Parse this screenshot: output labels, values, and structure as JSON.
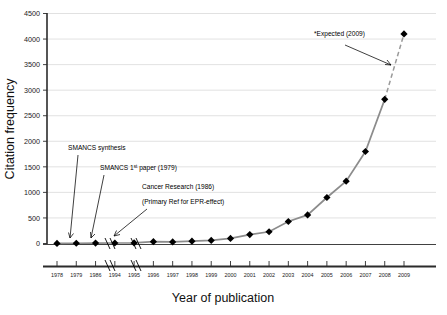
{
  "chart_data": {
    "type": "line",
    "title": "",
    "xlabel": "Year of publication",
    "ylabel": "Citation frequency",
    "ylim": [
      0,
      4500
    ],
    "ytick_step": 500,
    "grid": true,
    "legend": "none",
    "categories": [
      "1978",
      "1979",
      "1986",
      "1994",
      "1995",
      "1996",
      "1997",
      "1998",
      "1999",
      "2000",
      "2001",
      "2002",
      "2003",
      "2004",
      "2005",
      "2006",
      "2007",
      "2008",
      "2009"
    ],
    "values": [
      2,
      5,
      8,
      10,
      12,
      35,
      30,
      45,
      60,
      100,
      175,
      230,
      430,
      560,
      900,
      1220,
      1800,
      2820,
      4100
    ],
    "series": [
      {
        "name": "Citations",
        "values": [
          2,
          5,
          8,
          10,
          12,
          35,
          30,
          45,
          60,
          100,
          175,
          230,
          430,
          560,
          900,
          1220,
          1800,
          2820,
          4100
        ]
      }
    ],
    "projected_point": {
      "x": "2009",
      "y": 4100,
      "style": "dashed",
      "note": "*Expected (2009)"
    },
    "axis_breaks": [
      {
        "between": [
          "1979",
          "1986"
        ]
      },
      {
        "between": [
          "1986",
          "1994"
        ]
      }
    ],
    "annotations": [
      {
        "text": "SMANCS synthesis",
        "points_to": "1978"
      },
      {
        "text": "SMANCS 1",
        "sup": "st",
        "text_tail": " paper (1979)",
        "points_to": "1979"
      },
      {
        "text": "Cancer Research (1986)",
        "points_to": "1986"
      },
      {
        "text": "(Primary Ref for EPR-effect)",
        "points_to": "1986"
      },
      {
        "text": "*Expected (2009)",
        "points_to": "2009"
      }
    ],
    "ytick_labels": [
      "0",
      "500",
      "1000",
      "1500",
      "2000",
      "2500",
      "3000",
      "3500",
      "4000",
      "4500"
    ],
    "colors": {
      "line": "#8c8c8c",
      "marker": "#000000",
      "grid": "#d9d9d9",
      "axis": "#2b2b2b",
      "text": "#111111"
    }
  }
}
